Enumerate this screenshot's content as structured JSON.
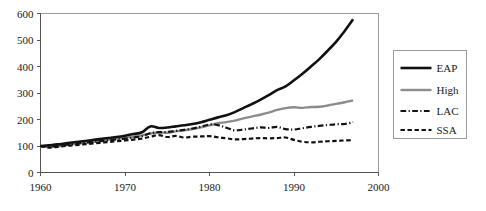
{
  "chart_data": {
    "type": "line",
    "title": "",
    "subtitle": "",
    "xlabel": "",
    "ylabel": "",
    "xlim": [
      1960,
      2000
    ],
    "ylim": [
      0,
      600
    ],
    "xticks": [
      1960,
      1970,
      1980,
      1990,
      2000
    ],
    "yticks": [
      0,
      100,
      200,
      300,
      400,
      500,
      600
    ],
    "xtick_labels": [
      "1960",
      "1970",
      "1980",
      "1990",
      "2000"
    ],
    "ytick_labels": [
      "0",
      "100",
      "200",
      "300",
      "400",
      "500",
      "600"
    ],
    "grid": false,
    "legend_position": "right-outside",
    "x": [
      1960,
      1961,
      1962,
      1963,
      1964,
      1965,
      1966,
      1967,
      1968,
      1969,
      1970,
      1971,
      1972,
      1973,
      1974,
      1975,
      1976,
      1977,
      1978,
      1979,
      1980,
      1981,
      1982,
      1983,
      1984,
      1985,
      1986,
      1987,
      1988,
      1989,
      1990,
      1991,
      1992,
      1993,
      1994,
      1995,
      1996,
      1997
    ],
    "series": [
      {
        "name": "EAP",
        "color": "#111111",
        "style": "solid",
        "width": 2.6,
        "values": [
          100,
          103,
          106,
          110,
          114,
          118,
          122,
          126,
          130,
          134,
          139,
          145,
          152,
          174,
          168,
          170,
          174,
          178,
          183,
          190,
          199,
          208,
          216,
          228,
          243,
          258,
          274,
          292,
          311,
          325,
          348,
          373,
          400,
          428,
          460,
          494,
          534,
          578
        ]
      },
      {
        "name": "High",
        "color": "#8c8c8c",
        "style": "solid",
        "width": 2.4,
        "values": [
          98,
          96,
          99,
          103,
          107,
          111,
          115,
          119,
          123,
          127,
          131,
          135,
          140,
          147,
          151,
          150,
          155,
          159,
          164,
          170,
          178,
          186,
          190,
          196,
          204,
          211,
          218,
          226,
          236,
          243,
          246,
          244,
          247,
          248,
          253,
          259,
          265,
          272
        ]
      },
      {
        "name": "LAC",
        "color": "#111111",
        "style": "dashdot",
        "width": 2.2,
        "values": [
          100,
          99,
          102,
          105,
          108,
          112,
          115,
          118,
          121,
          125,
          128,
          132,
          137,
          148,
          152,
          153,
          157,
          161,
          166,
          173,
          181,
          179,
          169,
          159,
          162,
          166,
          170,
          168,
          172,
          164,
          162,
          167,
          172,
          176,
          179,
          182,
          183,
          190
        ]
      },
      {
        "name": "SSA",
        "color": "#111111",
        "style": "dashed",
        "width": 2.2,
        "values": [
          100,
          94,
          97,
          100,
          103,
          106,
          109,
          112,
          115,
          118,
          121,
          124,
          128,
          135,
          141,
          134,
          138,
          132,
          135,
          136,
          137,
          133,
          129,
          125,
          126,
          128,
          130,
          129,
          130,
          132,
          123,
          116,
          114,
          116,
          118,
          119,
          121,
          122
        ]
      }
    ]
  },
  "legend": {
    "entries": [
      {
        "label": "EAP"
      },
      {
        "label": "High"
      },
      {
        "label": "LAC"
      },
      {
        "label": "SSA"
      }
    ]
  },
  "colors": {
    "eap": "#111111",
    "high": "#8c8c8c",
    "lac": "#111111",
    "ssa": "#111111",
    "axis": "#555555",
    "frame": "#9a9a9a",
    "background": "#ffffff"
  }
}
